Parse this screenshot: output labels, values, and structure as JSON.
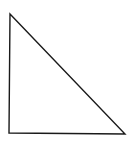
{
  "diagram": {
    "type": "right-triangle",
    "background": "#ffffff",
    "stroke_color": "#1a1a1a",
    "stroke_width": 1.4,
    "vertices": {
      "top": [
        10,
        14
      ],
      "bottom_left": [
        9,
        133
      ],
      "bottom_right": [
        125,
        134
      ]
    },
    "labels": []
  }
}
